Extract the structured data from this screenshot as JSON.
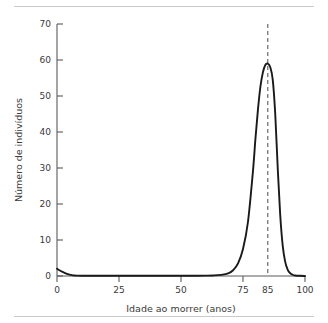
{
  "figure": {
    "background_color": "#ffffff",
    "rule_color": "#c9c9c9",
    "curve_color": "#1a1a1a",
    "axis_color": "#5a5a5a",
    "marker_line_color": "#4a4a4a"
  },
  "chart_data": {
    "type": "line",
    "title": "",
    "xlabel": "Idade ao morrer (anos)",
    "ylabel": "Número de indivíduos",
    "xlim": [
      0,
      100
    ],
    "ylim": [
      0,
      70
    ],
    "grid": false,
    "legend": null,
    "xticks": [
      0,
      25,
      50,
      75,
      85,
      100
    ],
    "xtick_labels": [
      "0",
      "25",
      "50",
      "75",
      "85",
      "100"
    ],
    "yticks": [
      0,
      10,
      20,
      30,
      40,
      50,
      60,
      70
    ],
    "ytick_labels": [
      "0",
      "10",
      "20",
      "30",
      "40",
      "50",
      "60",
      "70"
    ],
    "annotations": [
      {
        "name": "modal-age-marker",
        "type": "vertical-dashed-line",
        "x": 85,
        "label": "85"
      }
    ],
    "series": [
      {
        "name": "Distribuição de mortes por idade",
        "x": [
          0,
          1,
          2,
          3,
          4,
          5,
          6,
          7,
          8,
          10,
          15,
          20,
          25,
          30,
          35,
          40,
          45,
          50,
          55,
          60,
          63,
          66,
          69,
          71,
          73,
          75,
          77,
          79,
          80,
          81,
          82,
          83,
          84,
          85,
          86,
          87,
          88,
          89,
          90,
          91,
          92,
          93,
          94,
          95,
          96,
          98,
          100
        ],
        "y": [
          2.0,
          1.6,
          1.2,
          0.9,
          0.6,
          0.4,
          0.25,
          0.15,
          0.1,
          0.07,
          0.05,
          0.05,
          0.05,
          0.05,
          0.05,
          0.05,
          0.05,
          0.05,
          0.06,
          0.1,
          0.15,
          0.3,
          0.7,
          1.6,
          3.5,
          7.5,
          15.0,
          29.0,
          38.0,
          46.0,
          52.5,
          56.5,
          58.6,
          59.0,
          58.0,
          54.5,
          45.0,
          30.0,
          17.0,
          8.5,
          4.0,
          1.8,
          0.8,
          0.35,
          0.15,
          0.05,
          0.0
        ]
      }
    ]
  }
}
